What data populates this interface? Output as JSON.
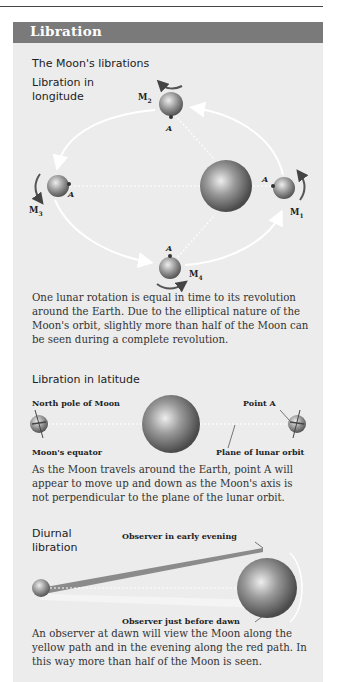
{
  "header": {
    "title": "Libration"
  },
  "section_main": {
    "title": "The Moon's librations"
  },
  "longitude": {
    "title_line1": "Libration in",
    "title_line2": "longitude",
    "moons": [
      {
        "label": "M",
        "sub": "1",
        "point": "A"
      },
      {
        "label": "M",
        "sub": "2",
        "point": "A"
      },
      {
        "label": "M",
        "sub": "3",
        "point": "A"
      },
      {
        "label": "M",
        "sub": "4",
        "point": "A"
      }
    ],
    "caption": "One lunar rotation is equal in time to its revolution around the Earth. Due to the elliptical nature of the Moon's orbit, slightly more than half of the Moon can be seen during a complete revolution."
  },
  "latitude": {
    "title": "Libration in latitude",
    "labels": {
      "north_pole": "North pole of Moon",
      "equator": "Moon's equator",
      "point_a": "Point A",
      "plane": "Plane of lunar orbit"
    },
    "caption": "As the Moon travels around the Earth, point A will appear to move up and down as the Moon's axis is not perpendicular to the plane of the lunar orbit."
  },
  "diurnal": {
    "title_line1": "Diurnal",
    "title_line2": "libration",
    "labels": {
      "evening": "Observer in early evening",
      "dawn": "Observer just before dawn"
    },
    "caption": "An observer at dawn will view the Moon along the yellow path and in the evening along the red path. In this way more than half of the Moon is seen."
  },
  "colors": {
    "header_bg": "#7a7a7a",
    "panel_bg": "#ececec",
    "earth": "#8a8a8a",
    "moon": "#a8a8a8"
  }
}
